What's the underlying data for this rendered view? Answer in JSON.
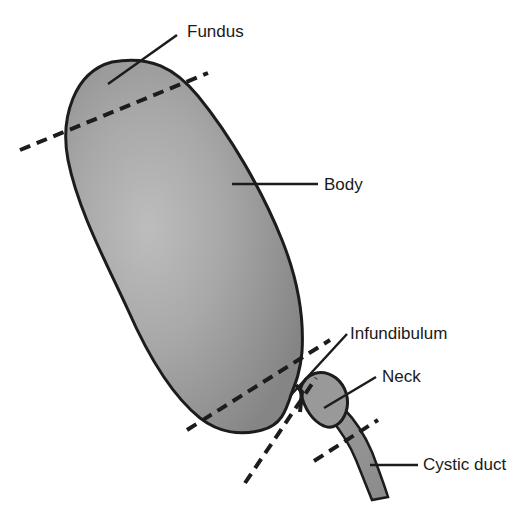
{
  "diagram": {
    "labels": {
      "fundus": "Fundus",
      "body": "Body",
      "infundibulum": "Infundibulum",
      "neck": "Neck",
      "cystic_duct": "Cystic duct"
    },
    "colors": {
      "organ_fill_light": "#c4c4c4",
      "organ_fill_dark": "#8a8a8a",
      "outline": "#1c1c1c",
      "leader_line": "#1c1c1c",
      "label_text": "#1a1a1a"
    }
  }
}
